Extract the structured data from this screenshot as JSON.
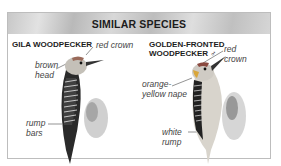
{
  "header": {
    "title": "SIMILAR SPECIES"
  },
  "species": [
    {
      "name": "GILA WOODPECKER",
      "labels": {
        "crown": "red crown",
        "head_1": "brown",
        "head_2": "head",
        "rump_1": "rump",
        "rump_2": "bars"
      }
    },
    {
      "name_1": "GOLDEN-FRONTED",
      "name_2": "WOODPECKER ♂",
      "labels": {
        "crown_1": "red",
        "crown_2": "crown",
        "nape_1": "orange-",
        "nape_2": "yellow nape",
        "rump_1": "white",
        "rump_2": "rump"
      }
    }
  ],
  "colors": {
    "header_bg": "#c8c8c8",
    "border": "#bdbdbd",
    "text": "#1c1c1c"
  }
}
